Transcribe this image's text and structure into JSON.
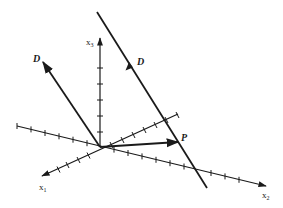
{
  "diagram": {
    "type": "3d-coordinate-axes-with-line",
    "colors": {
      "ink": "#1a1a1a",
      "background": "#ffffff"
    },
    "origin": [
      100,
      147
    ],
    "axes": [
      {
        "id": "x1",
        "label": "x",
        "subscript": "1",
        "from": [
          178,
          114
        ],
        "to": [
          42,
          176
        ],
        "label_pos": [
          39,
          190
        ]
      },
      {
        "id": "x2",
        "label": "x",
        "subscript": "2",
        "from": [
          17,
          126
        ],
        "to": [
          266,
          186
        ],
        "label_pos": [
          262,
          198
        ]
      },
      {
        "id": "x3",
        "label": "x",
        "subscript": "3",
        "from": [
          100,
          147
        ],
        "to": [
          100,
          38
        ],
        "label_pos": [
          86,
          45
        ]
      }
    ],
    "vectors": [
      {
        "id": "D-origin",
        "label": "D",
        "from": [
          100,
          147
        ],
        "to": [
          43,
          62
        ],
        "label_pos": [
          33,
          62
        ]
      },
      {
        "id": "P",
        "label": "P",
        "from": [
          100,
          147
        ],
        "to": [
          178,
          142
        ],
        "label_pos": [
          181,
          141
        ]
      }
    ],
    "line": {
      "id": "line-through-P",
      "from": [
        97,
        12
      ],
      "to": [
        207,
        188
      ],
      "arrow_at": [
        129,
        62
      ],
      "label": "D",
      "label_pos": [
        137,
        65
      ]
    }
  }
}
